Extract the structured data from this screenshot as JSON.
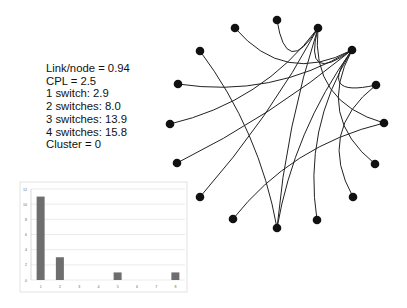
{
  "stats": {
    "lines": [
      "Link/node = 0.94",
      "CPL = 2.5",
      "1 switch: 2.9",
      "2 switches: 8.0",
      "3 switches: 13.9",
      "4 switches: 15.8",
      "Cluster = 0"
    ]
  },
  "network": {
    "node_color": "#111111",
    "edge_color": "#222222",
    "nodes": [
      [
        277,
        20
      ],
      [
        318,
        28
      ],
      [
        235,
        28
      ],
      [
        352,
        50
      ],
      [
        200,
        51
      ],
      [
        376,
        85
      ],
      [
        178,
        84
      ],
      [
        384,
        123
      ],
      [
        170,
        124
      ],
      [
        177,
        163
      ],
      [
        375,
        164
      ],
      [
        353,
        197
      ],
      [
        200,
        197
      ],
      [
        233,
        219
      ],
      [
        317,
        220
      ],
      [
        277,
        228
      ]
    ],
    "edges": [
      [
        0,
        1
      ],
      [
        1,
        8
      ],
      [
        1,
        12
      ],
      [
        1,
        3
      ],
      [
        1,
        7
      ],
      [
        3,
        2
      ],
      [
        3,
        6
      ],
      [
        3,
        9
      ],
      [
        3,
        5
      ],
      [
        3,
        15
      ],
      [
        3,
        14
      ],
      [
        3,
        10
      ],
      [
        4,
        15
      ],
      [
        5,
        11
      ],
      [
        7,
        13
      ],
      [
        1,
        15
      ]
    ]
  },
  "chart_data": {
    "type": "bar",
    "title": "",
    "xlabel": "",
    "ylabel": "",
    "categories": [
      "1",
      "2",
      "3",
      "4",
      "5",
      "6",
      "7",
      "8"
    ],
    "values": [
      11,
      3,
      0,
      0,
      1,
      0,
      0,
      1
    ],
    "ylim": [
      0,
      12
    ],
    "yticks": [
      0,
      2,
      4,
      6,
      8,
      10,
      12
    ],
    "grid": true,
    "bar_color": "#6e6e6e"
  }
}
